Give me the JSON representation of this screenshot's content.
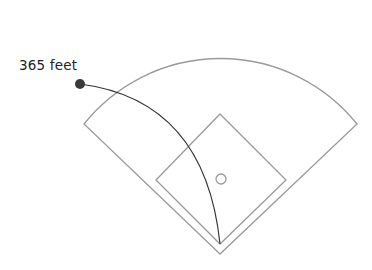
{
  "hit": {
    "distance_label": "365 feet",
    "distance_feet": 365
  },
  "colors": {
    "field_lines": "#9a9a9a",
    "trajectory": "#333333",
    "ball": "#3a3a3a",
    "text": "#222222"
  }
}
